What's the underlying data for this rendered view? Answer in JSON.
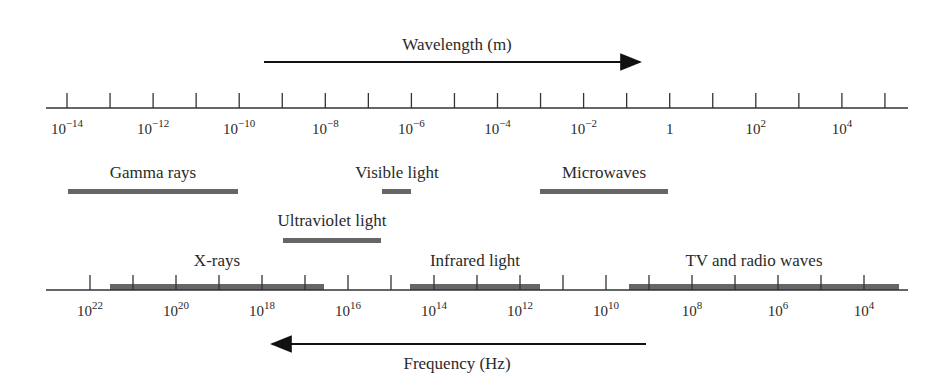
{
  "wavelength_axis": {
    "label": "Wavelength (m)",
    "direction": "increasing-right",
    "ticks": [
      {
        "label": "10",
        "exp": "−14"
      },
      {
        "label": "",
        "exp": ""
      },
      {
        "label": "10",
        "exp": "−12"
      },
      {
        "label": "",
        "exp": ""
      },
      {
        "label": "10",
        "exp": "−10"
      },
      {
        "label": "",
        "exp": ""
      },
      {
        "label": "10",
        "exp": "−8"
      },
      {
        "label": "",
        "exp": ""
      },
      {
        "label": "10",
        "exp": "−6"
      },
      {
        "label": "",
        "exp": ""
      },
      {
        "label": "10",
        "exp": "−4"
      },
      {
        "label": "",
        "exp": ""
      },
      {
        "label": "10",
        "exp": "−2"
      },
      {
        "label": "",
        "exp": ""
      },
      {
        "label": "1",
        "exp": ""
      },
      {
        "label": "",
        "exp": ""
      },
      {
        "label": "10",
        "exp": "2"
      },
      {
        "label": "",
        "exp": ""
      },
      {
        "label": "10",
        "exp": "4"
      },
      {
        "label": "",
        "exp": ""
      }
    ]
  },
  "frequency_axis": {
    "label": "Frequency (Hz)",
    "direction": "increasing-left",
    "ticks": [
      {
        "label": "10",
        "exp": "22"
      },
      {
        "label": "",
        "exp": ""
      },
      {
        "label": "10",
        "exp": "20"
      },
      {
        "label": "",
        "exp": ""
      },
      {
        "label": "10",
        "exp": "18"
      },
      {
        "label": "",
        "exp": ""
      },
      {
        "label": "10",
        "exp": "16"
      },
      {
        "label": "",
        "exp": ""
      },
      {
        "label": "10",
        "exp": "14"
      },
      {
        "label": "",
        "exp": ""
      },
      {
        "label": "10",
        "exp": "12"
      },
      {
        "label": "",
        "exp": ""
      },
      {
        "label": "10",
        "exp": "10"
      },
      {
        "label": "",
        "exp": ""
      },
      {
        "label": "10",
        "exp": "8"
      },
      {
        "label": "",
        "exp": ""
      },
      {
        "label": "10",
        "exp": "6"
      },
      {
        "label": "",
        "exp": ""
      },
      {
        "label": "10",
        "exp": "4"
      }
    ]
  },
  "bands": {
    "gamma": {
      "label": "Gamma rays"
    },
    "visible": {
      "label": "Visible light"
    },
    "microwaves": {
      "label": "Microwaves"
    },
    "ultraviolet": {
      "label": "Ultraviolet light"
    },
    "xrays": {
      "label": "X-rays"
    },
    "infrared": {
      "label": "Infrared light"
    },
    "tv_radio": {
      "label": "TV and radio waves"
    }
  },
  "colors": {
    "band": "#666666",
    "axis": "#333333",
    "arrow": "#111111"
  }
}
